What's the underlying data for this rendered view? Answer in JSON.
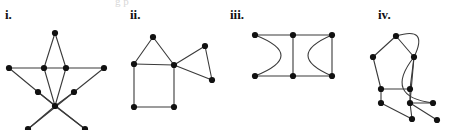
{
  "figure": {
    "width": 449,
    "height": 130,
    "background": "#ffffff",
    "edge_color": "#3a3a3a",
    "vertex_color": "#111111",
    "partial_top_text": "g  p"
  },
  "panels": [
    {
      "id": "panel-i",
      "label": "i.",
      "label_x": 5,
      "label_y": 8,
      "description": "pentagram (five-pointed star) with ten vertices",
      "vertices": [
        {
          "name": "apex",
          "x": 55,
          "y": 33
        },
        {
          "name": "left-point",
          "x": 9,
          "y": 68
        },
        {
          "name": "inner-top-left",
          "x": 44,
          "y": 68
        },
        {
          "name": "inner-top-right",
          "x": 66,
          "y": 68
        },
        {
          "name": "right-point",
          "x": 104,
          "y": 68
        },
        {
          "name": "inner-mid-left",
          "x": 38,
          "y": 92
        },
        {
          "name": "inner-mid-right",
          "x": 74,
          "y": 92
        },
        {
          "name": "inner-bottom",
          "x": 55,
          "y": 106
        },
        {
          "name": "bottom-left-point",
          "x": 28,
          "y": 129
        },
        {
          "name": "bottom-right-point",
          "x": 85,
          "y": 129
        }
      ],
      "edges": [
        {
          "from": 0,
          "to": 2,
          "curve": 0
        },
        {
          "from": 0,
          "to": 3,
          "curve": 0
        },
        {
          "from": 1,
          "to": 2,
          "curve": 0
        },
        {
          "from": 2,
          "to": 3,
          "curve": 0
        },
        {
          "from": 3,
          "to": 4,
          "curve": 0
        },
        {
          "from": 1,
          "to": 5,
          "curve": 0
        },
        {
          "from": 4,
          "to": 6,
          "curve": 0
        },
        {
          "from": 2,
          "to": 7,
          "curve": 0
        },
        {
          "from": 3,
          "to": 7,
          "curve": 0
        },
        {
          "from": 5,
          "to": 7,
          "curve": 0
        },
        {
          "from": 6,
          "to": 7,
          "curve": 0
        },
        {
          "from": 5,
          "to": 9,
          "curve": 0
        },
        {
          "from": 6,
          "to": 8,
          "curve": 0
        },
        {
          "from": 7,
          "to": 8,
          "curve": 0
        },
        {
          "from": 7,
          "to": 9,
          "curve": 0
        }
      ]
    },
    {
      "id": "panel-ii",
      "label": "ii.",
      "label_x": 130,
      "label_y": 8,
      "description": "square with triangle on top and triangle on right",
      "vertices": [
        {
          "name": "triangle-apex",
          "x": 153,
          "y": 37
        },
        {
          "name": "square-top-left",
          "x": 134,
          "y": 64
        },
        {
          "name": "square-top-right",
          "x": 174,
          "y": 65
        },
        {
          "name": "square-bottom-left",
          "x": 134,
          "y": 107
        },
        {
          "name": "square-bottom-right",
          "x": 174,
          "y": 107
        },
        {
          "name": "right-upper",
          "x": 205,
          "y": 46
        },
        {
          "name": "right-lower",
          "x": 212,
          "y": 80
        }
      ],
      "edges": [
        {
          "from": 0,
          "to": 1,
          "curve": 0
        },
        {
          "from": 0,
          "to": 2,
          "curve": 0
        },
        {
          "from": 1,
          "to": 2,
          "curve": 0
        },
        {
          "from": 1,
          "to": 3,
          "curve": 0
        },
        {
          "from": 2,
          "to": 4,
          "curve": 0
        },
        {
          "from": 3,
          "to": 4,
          "curve": 0
        },
        {
          "from": 2,
          "to": 5,
          "curve": 0
        },
        {
          "from": 2,
          "to": 6,
          "curve": 0
        },
        {
          "from": 5,
          "to": 6,
          "curve": 0
        }
      ]
    },
    {
      "id": "panel-iii",
      "label": "iii.",
      "label_x": 230,
      "label_y": 8,
      "description": "three-rung ladder closed by curved arcs at both ends",
      "vertices": [
        {
          "name": "top-left",
          "x": 255,
          "y": 35
        },
        {
          "name": "top-middle",
          "x": 293,
          "y": 35
        },
        {
          "name": "top-right",
          "x": 332,
          "y": 35
        },
        {
          "name": "bottom-left",
          "x": 255,
          "y": 76
        },
        {
          "name": "bottom-middle",
          "x": 293,
          "y": 76
        },
        {
          "name": "bottom-right",
          "x": 332,
          "y": 76
        }
      ],
      "edges": [
        {
          "from": 0,
          "to": 1,
          "curve": 0
        },
        {
          "from": 1,
          "to": 2,
          "curve": 0
        },
        {
          "from": 3,
          "to": 4,
          "curve": 0
        },
        {
          "from": 4,
          "to": 5,
          "curve": 0
        },
        {
          "from": 1,
          "to": 4,
          "curve": 0
        },
        {
          "from": 2,
          "to": 5,
          "curve": 0
        },
        {
          "from": 0,
          "to": 3,
          "curve": -26
        },
        {
          "from": 2,
          "to": 5,
          "curve": 24
        }
      ]
    },
    {
      "id": "panel-iv",
      "label": "iv.",
      "label_x": 378,
      "label_y": 8,
      "description": "pentagon-like graph with two curved arcs on the right",
      "vertices": [
        {
          "name": "top",
          "x": 396,
          "y": 36
        },
        {
          "name": "upper-left",
          "x": 373,
          "y": 57
        },
        {
          "name": "upper-right",
          "x": 414,
          "y": 57
        },
        {
          "name": "mid-left",
          "x": 381,
          "y": 89
        },
        {
          "name": "mid-right",
          "x": 410,
          "y": 89
        },
        {
          "name": "low-left",
          "x": 381,
          "y": 103
        },
        {
          "name": "low-mid",
          "x": 410,
          "y": 103
        },
        {
          "name": "low-right",
          "x": 433,
          "y": 103
        },
        {
          "name": "bottom-mid",
          "x": 412,
          "y": 119
        },
        {
          "name": "bottom-right",
          "x": 437,
          "y": 120
        }
      ],
      "edges": [
        {
          "from": 0,
          "to": 1,
          "curve": 0
        },
        {
          "from": 0,
          "to": 2,
          "curve": 0
        },
        {
          "from": 0,
          "to": 2,
          "curve": -16
        },
        {
          "from": 1,
          "to": 3,
          "curve": 0
        },
        {
          "from": 2,
          "to": 4,
          "curve": 0
        },
        {
          "from": 2,
          "to": 6,
          "curve": 0
        },
        {
          "from": 2,
          "to": 7,
          "curve": 22
        },
        {
          "from": 3,
          "to": 4,
          "curve": 0
        },
        {
          "from": 3,
          "to": 5,
          "curve": 0
        },
        {
          "from": 5,
          "to": 8,
          "curve": 0
        },
        {
          "from": 6,
          "to": 7,
          "curve": 0
        },
        {
          "from": 6,
          "to": 8,
          "curve": 0
        },
        {
          "from": 6,
          "to": 9,
          "curve": 0
        },
        {
          "from": 4,
          "to": 6,
          "curve": 0
        }
      ]
    }
  ]
}
